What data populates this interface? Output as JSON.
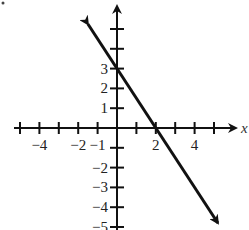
{
  "chart_data": {
    "type": "line",
    "title": "",
    "xlabel": "x",
    "ylabel": "y",
    "xlim": [
      -5,
      6
    ],
    "ylim": [
      -5,
      6
    ],
    "grid": false,
    "x_tick_labels": [
      "-4",
      "-2",
      "-1",
      "2",
      "4"
    ],
    "y_tick_labels": [
      "3",
      "2",
      "1",
      "-1",
      "-2",
      "-3",
      "-4",
      "-5"
    ],
    "series": [
      {
        "name": "line",
        "equation": "y = -3/2 x + 3",
        "slope": -1.5,
        "y_intercept": 3,
        "x_intercept": 2,
        "x": [
          -1.5,
          0,
          2,
          5.2
        ],
        "y": [
          5.25,
          3,
          0,
          -4.8
        ],
        "arrows_both_ends": true
      }
    ]
  },
  "labels": {
    "x_axis": "x",
    "ticks_x": [
      {
        "v": -4,
        "t": "−4"
      },
      {
        "v": -2,
        "t": "−2"
      },
      {
        "v": -1,
        "t": "−1"
      },
      {
        "v": 2,
        "t": "2"
      },
      {
        "v": 4,
        "t": "4"
      }
    ],
    "ticks_y": [
      {
        "v": 3,
        "t": "3"
      },
      {
        "v": 2,
        "t": "2"
      },
      {
        "v": 1,
        "t": "1"
      },
      {
        "v": -2,
        "t": "−2"
      },
      {
        "v": -3,
        "t": "−3"
      },
      {
        "v": -4,
        "t": "−4"
      },
      {
        "v": -5,
        "t": "−5"
      }
    ]
  }
}
